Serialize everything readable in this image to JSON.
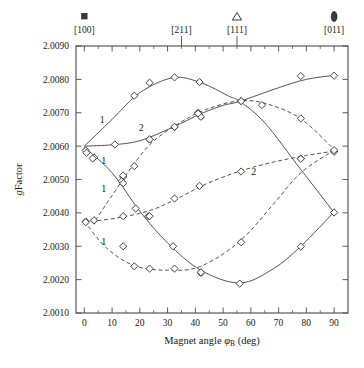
{
  "chart_data": {
    "type": "scatter",
    "title": "",
    "subtitle": "",
    "xlabel": "Magnet angle φB (deg)",
    "xlabel_parts": {
      "lead": "Magnet angle ",
      "symbol": "φ",
      "subscript": "B",
      "trail": " (deg)"
    },
    "ylabel": "g Factor",
    "ylabel_parts": {
      "italic": "g",
      "rest": "Factor"
    },
    "xlim": [
      -3,
      95
    ],
    "ylim": [
      2.001,
      2.009
    ],
    "xticks": [
      0,
      10,
      20,
      30,
      40,
      50,
      60,
      70,
      80,
      90
    ],
    "xtick_labels": [
      "0",
      "10",
      "20",
      "30",
      "40",
      "50",
      "60",
      "70",
      "80",
      "90"
    ],
    "x_minor_ticks": [
      5,
      15,
      25,
      35,
      45,
      55,
      65,
      75,
      85
    ],
    "yticks": [
      2.001,
      2.002,
      2.003,
      2.004,
      2.005,
      2.006,
      2.007,
      2.008,
      2.009
    ],
    "ytick_labels": [
      "2.0010",
      "2.0020",
      "2.0030",
      "2.0040",
      "2.0050",
      "2.0060",
      "2.0070",
      "2.0080",
      "2.0090"
    ],
    "grid": false,
    "legend_position": "none",
    "marker_style": "open-diamond",
    "top_axis": {
      "ticks": [
        {
          "x": 0,
          "label": "[100]",
          "symbol": "filled-square",
          "tick_drawn": false
        },
        {
          "x": 35,
          "label": "[211]",
          "symbol": "none",
          "tick_drawn": true
        },
        {
          "x": 55,
          "label": "[111]",
          "symbol": "open-triangle",
          "tick_drawn": true
        },
        {
          "x": 90,
          "label": "[011]",
          "symbol": "filled-ellipse",
          "tick_drawn": false
        }
      ]
    },
    "branch_labels": [
      {
        "text": "1",
        "x": 6.5,
        "y": 2.00668
      },
      {
        "text": "2",
        "x": 20.5,
        "y": 2.00645
      },
      {
        "text": "1",
        "x": 7.0,
        "y": 2.00545
      },
      {
        "text": "1",
        "x": 7.0,
        "y": 2.00462
      },
      {
        "text": "1",
        "x": 7.0,
        "y": 2.00305
      },
      {
        "text": "2",
        "x": 61.0,
        "y": 2.00512
      }
    ],
    "series": [
      {
        "name": "branch-1-upper-solid",
        "linestyle": "solid",
        "points": [
          {
            "x": 0.5,
            "y": 2.00587
          },
          {
            "x": 11.0,
            "y": 2.00605
          },
          {
            "x": 18.0,
            "y": 2.00751
          },
          {
            "x": 23.5,
            "y": 2.0079
          },
          {
            "x": 32.5,
            "y": 2.00806
          },
          {
            "x": 41.5,
            "y": 2.00792,
            "yerr": 5e-05
          },
          {
            "x": 56.5,
            "y": 2.00735
          },
          {
            "x": 78.0,
            "y": 2.0081
          },
          {
            "x": 90.0,
            "y": 2.00811
          }
        ],
        "fit": [
          {
            "x": 0,
            "y": 2.006
          },
          {
            "x": 10,
            "y": 2.0068
          },
          {
            "x": 20,
            "y": 2.0076
          },
          {
            "x": 32,
            "y": 2.00805
          },
          {
            "x": 42,
            "y": 2.0079
          },
          {
            "x": 52,
            "y": 2.0075
          },
          {
            "x": 56,
            "y": 2.00734
          },
          {
            "x": 65,
            "y": 2.0067
          },
          {
            "x": 78,
            "y": 2.0053
          },
          {
            "x": 90,
            "y": 2.00401
          }
        ]
      },
      {
        "name": "branch-2-solid",
        "linestyle": "solid",
        "points": [
          {
            "x": 3.5,
            "y": 2.00566
          },
          {
            "x": 14.0,
            "y": 2.00508
          },
          {
            "x": 23.5,
            "y": 2.0062
          },
          {
            "x": 32.5,
            "y": 2.00657
          },
          {
            "x": 41.0,
            "y": 2.007
          },
          {
            "x": 42.0,
            "y": 2.00688,
            "yerr": 6e-05
          }
        ],
        "fit": [
          {
            "x": 0,
            "y": 2.006
          },
          {
            "x": 10,
            "y": 2.00604
          },
          {
            "x": 20,
            "y": 2.00616
          },
          {
            "x": 32,
            "y": 2.00657
          },
          {
            "x": 42,
            "y": 2.00697
          },
          {
            "x": 50,
            "y": 2.00722
          },
          {
            "x": 56,
            "y": 2.00734
          },
          {
            "x": 70,
            "y": 2.00775
          },
          {
            "x": 80,
            "y": 2.008
          },
          {
            "x": 90,
            "y": 2.00812
          }
        ]
      },
      {
        "name": "branch-1-descending-solid",
        "linestyle": "solid",
        "points": [
          {
            "x": 0.8,
            "y": 2.0058
          },
          {
            "x": 3.0,
            "y": 2.00563
          },
          {
            "x": 13.5,
            "y": 2.00495
          },
          {
            "x": 14.0,
            "y": 2.00489
          },
          {
            "x": 18.5,
            "y": 2.00413
          },
          {
            "x": 23.0,
            "y": 2.0039
          },
          {
            "x": 32.0,
            "y": 2.003
          },
          {
            "x": 42.0,
            "y": 2.0022,
            "yerr": 6e-05
          },
          {
            "x": 56.0,
            "y": 2.00188
          },
          {
            "x": 78.0,
            "y": 2.00299
          },
          {
            "x": 90.0,
            "y": 2.00401
          }
        ],
        "fit": [
          {
            "x": 0,
            "y": 2.00597
          },
          {
            "x": 10,
            "y": 2.0052
          },
          {
            "x": 20,
            "y": 2.00405
          },
          {
            "x": 30,
            "y": 2.0031
          },
          {
            "x": 42,
            "y": 2.00228
          },
          {
            "x": 56,
            "y": 2.0019
          },
          {
            "x": 68,
            "y": 2.00232
          },
          {
            "x": 78,
            "y": 2.003
          },
          {
            "x": 90,
            "y": 2.00403
          }
        ]
      },
      {
        "name": "branch-1-lower-dashed",
        "linestyle": "dashed",
        "points": [
          {
            "x": 0.5,
            "y": 2.00374
          },
          {
            "x": 3.5,
            "y": 2.00377
          },
          {
            "x": 14.0,
            "y": 2.003
          },
          {
            "x": 18.0,
            "y": 2.0024
          },
          {
            "x": 23.5,
            "y": 2.00233
          },
          {
            "x": 32.5,
            "y": 2.00233
          },
          {
            "x": 42.0,
            "y": 2.00222
          },
          {
            "x": 56.5,
            "y": 2.00312
          },
          {
            "x": 78.0,
            "y": 2.00563
          },
          {
            "x": 90.0,
            "y": 2.00585
          }
        ],
        "fit": [
          {
            "x": 0,
            "y": 2.00375
          },
          {
            "x": 8,
            "y": 2.00295
          },
          {
            "x": 18,
            "y": 2.00242
          },
          {
            "x": 30,
            "y": 2.00228
          },
          {
            "x": 42,
            "y": 2.0024
          },
          {
            "x": 56,
            "y": 2.00315
          },
          {
            "x": 68,
            "y": 2.00425
          },
          {
            "x": 78,
            "y": 2.0052
          },
          {
            "x": 90,
            "y": 2.00588
          }
        ]
      },
      {
        "name": "branch-2-lower-dashed",
        "linestyle": "dashed",
        "points": [
          {
            "x": 0.5,
            "y": 2.00372
          },
          {
            "x": 3.5,
            "y": 2.00378
          },
          {
            "x": 14.0,
            "y": 2.0039
          },
          {
            "x": 23.5,
            "y": 2.0039
          },
          {
            "x": 32.5,
            "y": 2.00443
          },
          {
            "x": 41.5,
            "y": 2.00481
          },
          {
            "x": 56.5,
            "y": 2.00524
          },
          {
            "x": 78.0,
            "y": 2.00562
          },
          {
            "x": 90.0,
            "y": 2.00583
          }
        ],
        "fit": [
          {
            "x": 0,
            "y": 2.00372
          },
          {
            "x": 12,
            "y": 2.00385
          },
          {
            "x": 24,
            "y": 2.00408
          },
          {
            "x": 34,
            "y": 2.00445
          },
          {
            "x": 44,
            "y": 2.00487
          },
          {
            "x": 56,
            "y": 2.00525
          },
          {
            "x": 68,
            "y": 2.00552
          },
          {
            "x": 80,
            "y": 2.00572
          },
          {
            "x": 90,
            "y": 2.00585
          }
        ]
      },
      {
        "name": "branch-crossing-dashed",
        "linestyle": "dashed",
        "points": [
          {
            "x": 14.0,
            "y": 2.00512
          },
          {
            "x": 18.0,
            "y": 2.0054
          },
          {
            "x": 23.5,
            "y": 2.0062
          },
          {
            "x": 32.5,
            "y": 2.00658
          },
          {
            "x": 41.0,
            "y": 2.00698
          },
          {
            "x": 56.5,
            "y": 2.00735
          },
          {
            "x": 64.0,
            "y": 2.00723
          },
          {
            "x": 78.0,
            "y": 2.00683
          },
          {
            "x": 90.0,
            "y": 2.00588
          }
        ],
        "fit": [
          {
            "x": 4,
            "y": 2.00378
          },
          {
            "x": 10,
            "y": 2.00452
          },
          {
            "x": 16,
            "y": 2.00525
          },
          {
            "x": 24,
            "y": 2.00608
          },
          {
            "x": 34,
            "y": 2.00668
          },
          {
            "x": 44,
            "y": 2.0071
          },
          {
            "x": 56,
            "y": 2.00736
          },
          {
            "x": 66,
            "y": 2.00726
          },
          {
            "x": 78,
            "y": 2.00682
          },
          {
            "x": 90,
            "y": 2.0059
          }
        ]
      }
    ]
  }
}
